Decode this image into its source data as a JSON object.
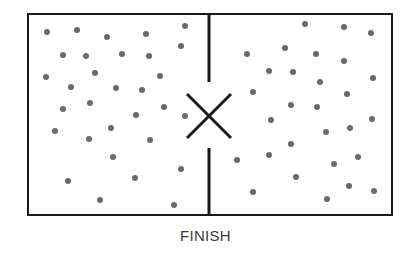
{
  "diagram": {
    "caption": "FINISH",
    "colors": {
      "outline": "#1a1a1a",
      "dot": "#6a6a6a",
      "background": "#ffffff",
      "caption": "#3a3a3a"
    },
    "container": {
      "x": 28,
      "y": 14,
      "width": 364,
      "height": 201,
      "stroke_width": 2
    },
    "partition": {
      "x": 209,
      "top_segment": {
        "y1": 14,
        "y2": 82
      },
      "bottom_segment": {
        "y1": 148,
        "y2": 215
      },
      "stroke_width": 3
    },
    "opening_marker": {
      "shape": "X",
      "center": {
        "x": 209,
        "y": 116
      },
      "half_size": 22,
      "stroke_width": 3
    },
    "dot_radius": 3,
    "left_chamber": {
      "label": "left-chamber",
      "particles": [
        [
          47,
          32
        ],
        [
          77,
          30
        ],
        [
          107,
          37
        ],
        [
          146,
          34
        ],
        [
          185,
          26
        ],
        [
          63,
          55
        ],
        [
          86,
          56
        ],
        [
          122,
          54
        ],
        [
          149,
          56
        ],
        [
          181,
          46
        ],
        [
          46,
          77
        ],
        [
          95,
          73
        ],
        [
          160,
          76
        ],
        [
          71,
          87
        ],
        [
          116,
          88
        ],
        [
          142,
          90
        ],
        [
          63,
          109
        ],
        [
          90,
          103
        ],
        [
          164,
          107
        ],
        [
          136,
          115
        ],
        [
          185,
          116
        ],
        [
          111,
          128
        ],
        [
          55,
          131
        ],
        [
          89,
          139
        ],
        [
          150,
          140
        ],
        [
          113,
          157
        ],
        [
          181,
          169
        ],
        [
          68,
          181
        ],
        [
          135,
          178
        ],
        [
          100,
          200
        ],
        [
          174,
          205
        ]
      ]
    },
    "right_chamber": {
      "label": "right-chamber",
      "particles": [
        [
          305,
          24
        ],
        [
          344,
          27
        ],
        [
          371,
          33
        ],
        [
          247,
          54
        ],
        [
          285,
          48
        ],
        [
          316,
          54
        ],
        [
          344,
          61
        ],
        [
          269,
          71
        ],
        [
          293,
          72
        ],
        [
          320,
          82
        ],
        [
          373,
          78
        ],
        [
          253,
          92
        ],
        [
          347,
          94
        ],
        [
          291,
          105
        ],
        [
          317,
          107
        ],
        [
          271,
          120
        ],
        [
          350,
          128
        ],
        [
          372,
          119
        ],
        [
          326,
          132
        ],
        [
          291,
          144
        ],
        [
          237,
          160
        ],
        [
          269,
          155
        ],
        [
          334,
          164
        ],
        [
          358,
          157
        ],
        [
          296,
          177
        ],
        [
          253,
          192
        ],
        [
          349,
          186
        ],
        [
          374,
          191
        ],
        [
          327,
          199
        ]
      ]
    }
  }
}
